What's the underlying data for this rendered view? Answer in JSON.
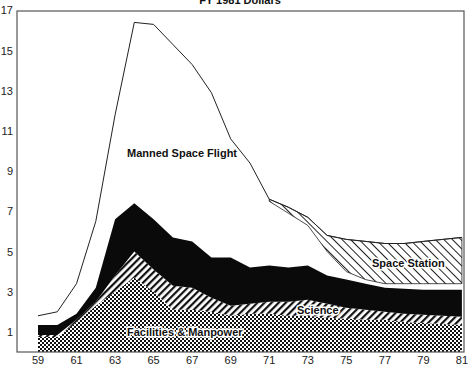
{
  "chart_data": {
    "type": "area",
    "title": "FY 1981 Dollars",
    "xlabel": "",
    "ylabel": "",
    "xlim": [
      59,
      81
    ],
    "ylim": [
      0,
      17
    ],
    "grid": false,
    "legend": "inline labels",
    "x": [
      59,
      60,
      61,
      62,
      63,
      64,
      65,
      66,
      67,
      68,
      69,
      70,
      71,
      72,
      73,
      74,
      75,
      76,
      77,
      78,
      79,
      80,
      81
    ],
    "x_tick_labels": [
      "59",
      "61",
      "63",
      "65",
      "67",
      "69",
      "71",
      "73",
      "75",
      "77",
      "79",
      "81"
    ],
    "y_tick_labels": [
      "1",
      "3",
      "5",
      "7",
      "9",
      "11",
      "13",
      "15",
      "17"
    ],
    "stack_tops": {
      "facilities_manpower": [
        0.75,
        0.75,
        1.5,
        2.3,
        3.0,
        3.7,
        3.0,
        2.1,
        2.1,
        2.0,
        1.8,
        1.9,
        1.9,
        1.8,
        1.8,
        1.7,
        1.65,
        1.6,
        1.6,
        1.5,
        1.45,
        1.4,
        1.35
      ],
      "science": [
        0.85,
        0.85,
        1.6,
        2.5,
        3.8,
        5.0,
        4.1,
        3.3,
        3.2,
        2.7,
        2.3,
        2.4,
        2.5,
        2.5,
        2.6,
        2.4,
        2.2,
        2.1,
        2.0,
        1.9,
        1.85,
        1.8,
        1.75
      ],
      "black_unlabeled": [
        1.35,
        1.35,
        1.9,
        3.2,
        6.6,
        7.4,
        6.6,
        5.7,
        5.5,
        4.7,
        4.7,
        4.2,
        4.3,
        4.2,
        4.3,
        3.8,
        3.6,
        3.4,
        3.2,
        3.15,
        3.1,
        3.1,
        3.1
      ],
      "space_station_bottom": [
        null,
        null,
        null,
        null,
        null,
        null,
        null,
        null,
        null,
        null,
        null,
        null,
        7.5,
        6.9,
        6.3,
        5.0,
        4.0,
        3.6,
        3.4,
        3.4,
        3.4,
        3.4,
        3.4
      ],
      "total_top": [
        1.8,
        2.0,
        3.4,
        6.5,
        11.8,
        16.4,
        16.3,
        15.3,
        14.3,
        12.9,
        10.6,
        9.4,
        7.6,
        7.2,
        6.7,
        5.8,
        5.6,
        5.5,
        5.4,
        5.4,
        5.5,
        5.6,
        5.7
      ]
    },
    "series": [
      {
        "name": "Facilities & Manpower",
        "pattern": "crosshatch",
        "values": [
          0.75,
          0.75,
          1.5,
          2.3,
          3.0,
          3.7,
          3.0,
          2.1,
          2.1,
          2.0,
          1.8,
          1.9,
          1.9,
          1.8,
          1.8,
          1.7,
          1.65,
          1.6,
          1.6,
          1.5,
          1.45,
          1.4,
          1.35
        ]
      },
      {
        "name": "Science",
        "pattern": "diagonal-back",
        "values": [
          0.1,
          0.1,
          0.1,
          0.2,
          0.8,
          1.3,
          1.1,
          1.2,
          1.1,
          0.7,
          0.5,
          0.5,
          0.6,
          0.7,
          0.8,
          0.7,
          0.55,
          0.5,
          0.4,
          0.4,
          0.4,
          0.4,
          0.4
        ]
      },
      {
        "name": "(unlabeled, solid black)",
        "pattern": "solid",
        "values": [
          0.5,
          0.5,
          0.3,
          0.7,
          2.8,
          2.4,
          2.5,
          2.4,
          2.3,
          2.0,
          2.4,
          1.8,
          1.8,
          1.7,
          1.7,
          1.4,
          1.4,
          1.3,
          1.2,
          1.25,
          1.25,
          1.3,
          1.35
        ]
      },
      {
        "name": "Manned Space Flight",
        "pattern": "white",
        "values": [
          0.45,
          0.65,
          1.5,
          3.3,
          5.2,
          9.0,
          9.7,
          9.6,
          8.8,
          8.2,
          5.9,
          5.2,
          3.2,
          2.7,
          2.0,
          1.2,
          0.4,
          0.2,
          0.2,
          0.25,
          0.3,
          0.3,
          0.3
        ]
      },
      {
        "name": "Space Station",
        "pattern": "diagonal-forward",
        "values": [
          0,
          0,
          0,
          0,
          0,
          0,
          0,
          0,
          0,
          0,
          0,
          0,
          0.1,
          0.3,
          0.4,
          0.8,
          1.6,
          1.9,
          2.0,
          2.0,
          2.1,
          2.2,
          2.3
        ]
      }
    ],
    "annotations": [
      {
        "text": "Manned Space Flight",
        "x": 65.9,
        "y": 9.9
      },
      {
        "text": "Science",
        "x": 73.8,
        "y": 2.0
      },
      {
        "text": "Space Station",
        "x": 78.2,
        "y": 4.4
      },
      {
        "text": "Facilities & Manpower",
        "x": 65.4,
        "y": 1.0
      }
    ]
  }
}
